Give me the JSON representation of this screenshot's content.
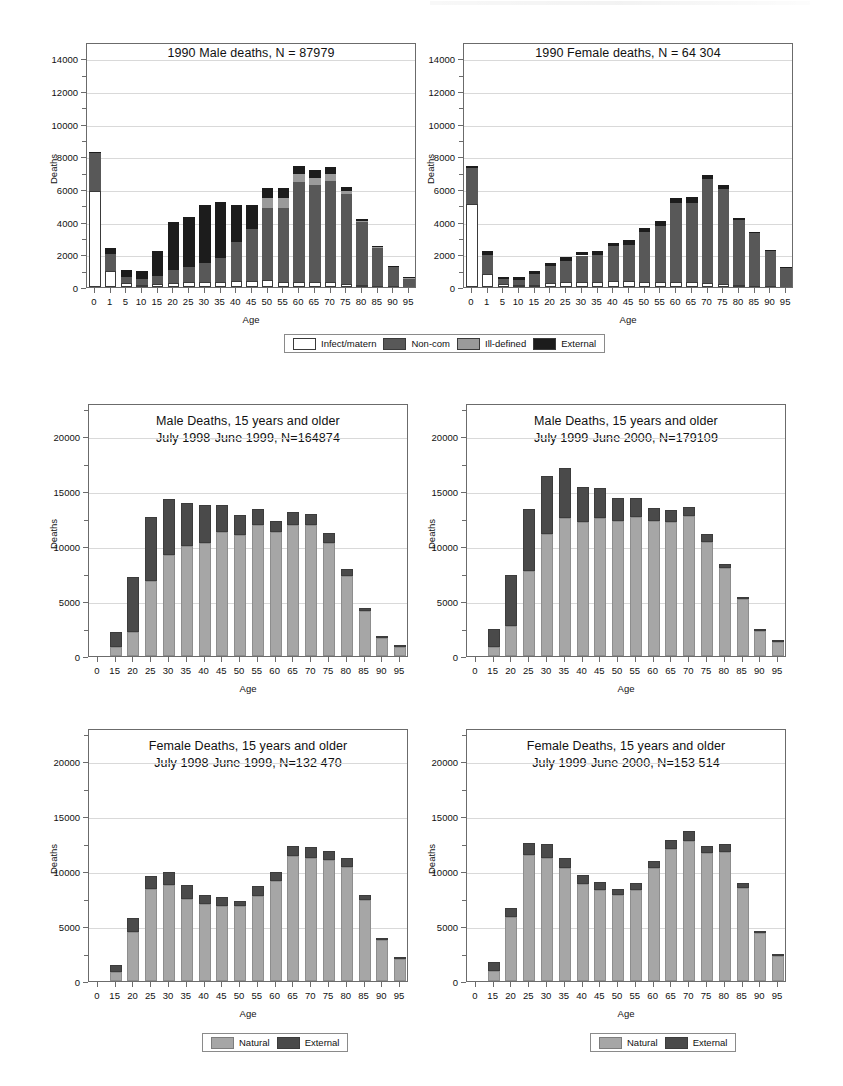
{
  "page": {
    "background": "#ffffff",
    "width": 843,
    "height": 1086
  },
  "colors": {
    "infect_matern": "#ffffff",
    "non_com": "#585858",
    "ill_defined": "#9a9a9a",
    "external_dark": "#1c1c1c",
    "natural": "#a6a6a6",
    "external": "#4a4a4a",
    "grid": "#d9d9d9",
    "axis": "#6b6b6b"
  },
  "legends": {
    "cause4": {
      "items": [
        {
          "label": "Infect/matern",
          "swatch": "infect"
        },
        {
          "label": "Non-com",
          "swatch": "noncom"
        },
        {
          "label": "Ill-defined",
          "swatch": "ill"
        },
        {
          "label": "External",
          "swatch": "external"
        }
      ]
    },
    "cause2_left": {
      "items": [
        {
          "label": "Natural",
          "swatch": "natural"
        },
        {
          "label": "External",
          "swatch": "extern2"
        }
      ]
    },
    "cause2_right": {
      "items": [
        {
          "label": "Natural",
          "swatch": "natural"
        },
        {
          "label": "External",
          "swatch": "extern2"
        }
      ]
    }
  },
  "chart_data": [
    {
      "id": "male-1990",
      "type": "bar",
      "stacked": true,
      "title": "1990 Male deaths, N = 87979",
      "title_lines": [
        "1990 Male deaths, N = 87979"
      ],
      "xlabel": "Age",
      "ylabel": "Deaths",
      "ylim": [
        0,
        15000
      ],
      "yticks": [
        0,
        2000,
        4000,
        6000,
        8000,
        10000,
        12000,
        14000
      ],
      "ytick_labels": [
        "0",
        "2000",
        "4000",
        "6000",
        "8000",
        "10000",
        "12000",
        "14000"
      ],
      "grid": true,
      "legend": "cause4",
      "legend_position": "below",
      "categories": [
        "0",
        "1",
        "5",
        "10",
        "15",
        "20",
        "25",
        "30",
        "35",
        "40",
        "45",
        "50",
        "55",
        "60",
        "65",
        "70",
        "75",
        "80",
        "85",
        "90",
        "95"
      ],
      "series": [
        {
          "name": "Infect/matern",
          "color": "#ffffff",
          "values": [
            5900,
            950,
            220,
            140,
            170,
            250,
            300,
            320,
            330,
            350,
            380,
            400,
            330,
            330,
            320,
            320,
            170,
            110,
            70,
            40,
            20
          ]
        },
        {
          "name": "Non-com",
          "color": "#585858",
          "values": [
            2300,
            1080,
            420,
            330,
            480,
            800,
            950,
            1150,
            1420,
            2400,
            3150,
            4450,
            4500,
            6100,
            5900,
            6200,
            5500,
            3850,
            2300,
            1190,
            540
          ]
        },
        {
          "name": "Ill-defined",
          "color": "#9a9a9a",
          "values": [
            0,
            0,
            0,
            0,
            0,
            0,
            0,
            0,
            0,
            0,
            0,
            620,
            620,
            480,
            480,
            420,
            230,
            100,
            80,
            40,
            20
          ]
        },
        {
          "name": "External",
          "color": "#1c1c1c",
          "values": [
            90,
            380,
            380,
            520,
            1570,
            2950,
            3050,
            3530,
            3450,
            2300,
            1490,
            620,
            600,
            480,
            440,
            420,
            230,
            120,
            70,
            40,
            20
          ]
        }
      ]
    },
    {
      "id": "female-1990",
      "type": "bar",
      "stacked": true,
      "title": "1990 Female deaths, N = 64 304",
      "title_lines": [
        "1990 Female deaths, N = 64 304"
      ],
      "xlabel": "Age",
      "ylabel": "Deaths",
      "ylim": [
        0,
        15000
      ],
      "yticks": [
        0,
        2000,
        4000,
        6000,
        8000,
        10000,
        12000,
        14000
      ],
      "ytick_labels": [
        "0",
        "2000",
        "4000",
        "6000",
        "8000",
        "10000",
        "12000",
        "14000"
      ],
      "grid": true,
      "legend": "cause4",
      "legend_position": "below",
      "categories": [
        "0",
        "1",
        "5",
        "10",
        "15",
        "20",
        "25",
        "30",
        "35",
        "40",
        "45",
        "50",
        "55",
        "60",
        "65",
        "70",
        "75",
        "80",
        "85",
        "90",
        "95"
      ],
      "series": [
        {
          "name": "Infect/matern",
          "color": "#ffffff",
          "values": [
            5100,
            800,
            180,
            120,
            150,
            230,
            280,
            300,
            320,
            340,
            340,
            330,
            330,
            320,
            320,
            250,
            200,
            130,
            80,
            50,
            20
          ]
        },
        {
          "name": "Non-com",
          "color": "#585858",
          "values": [
            2200,
            1150,
            320,
            330,
            640,
            1060,
            1310,
            1630,
            1670,
            2150,
            2250,
            3050,
            3400,
            4800,
            4850,
            6350,
            5800,
            4000,
            3200,
            2150,
            1200
          ]
        },
        {
          "name": "Ill-defined",
          "color": "#9a9a9a",
          "values": [
            0,
            0,
            0,
            0,
            0,
            0,
            0,
            0,
            0,
            0,
            0,
            0,
            0,
            0,
            0,
            0,
            0,
            0,
            0,
            0,
            0
          ]
        },
        {
          "name": "External",
          "color": "#1c1c1c",
          "values": [
            120,
            250,
            100,
            150,
            220,
            210,
            230,
            190,
            230,
            230,
            300,
            250,
            320,
            350,
            330,
            260,
            230,
            100,
            60,
            40,
            20
          ]
        }
      ]
    },
    {
      "id": "male-1998-1999",
      "type": "bar",
      "stacked": true,
      "title": "Male Deaths, 15 years and older",
      "title_lines": [
        "Male Deaths, 15 years and older",
        "July 1998-June 1999, N=164874"
      ],
      "xlabel": "Age",
      "ylabel": "Deaths",
      "ylim": [
        0,
        23000
      ],
      "yticks": [
        0,
        5000,
        10000,
        15000,
        20000
      ],
      "ytick_labels": [
        "0",
        "5000",
        "10000",
        "15000",
        "20000"
      ],
      "grid": true,
      "legend": null,
      "categories": [
        "0",
        "15",
        "20",
        "25",
        "30",
        "35",
        "40",
        "45",
        "50",
        "55",
        "60",
        "65",
        "70",
        "75",
        "80",
        "85",
        "90",
        "95"
      ],
      "series": [
        {
          "name": "Natural",
          "color": "#a6a6a6",
          "values": [
            0,
            800,
            2200,
            6800,
            9200,
            10000,
            10300,
            11300,
            11000,
            11900,
            11300,
            11950,
            11950,
            10300,
            7300,
            4100,
            1600,
            850
          ]
        },
        {
          "name": "External",
          "color": "#4a4a4a",
          "values": [
            0,
            1350,
            5000,
            5850,
            5100,
            3900,
            3400,
            2400,
            1800,
            1450,
            1000,
            1150,
            950,
            850,
            600,
            300,
            150,
            100
          ]
        }
      ]
    },
    {
      "id": "male-1999-2000",
      "type": "bar",
      "stacked": true,
      "title": "Male Deaths, 15 years and older",
      "title_lines": [
        "Male Deaths, 15 years and older",
        "July 1999-June 2000, N=179109"
      ],
      "xlabel": "Age",
      "ylabel": "Deaths",
      "ylim": [
        0,
        23000
      ],
      "yticks": [
        0,
        5000,
        10000,
        15000,
        20000
      ],
      "ytick_labels": [
        "0",
        "5000",
        "10000",
        "15000",
        "20000"
      ],
      "grid": true,
      "legend": null,
      "categories": [
        "0",
        "15",
        "20",
        "25",
        "30",
        "35",
        "40",
        "45",
        "50",
        "55",
        "60",
        "65",
        "70",
        "75",
        "80",
        "85",
        "90",
        "95"
      ],
      "series": [
        {
          "name": "Natural",
          "color": "#a6a6a6",
          "values": [
            0,
            800,
            2750,
            7700,
            11050,
            12550,
            12150,
            12550,
            12250,
            12600,
            12300,
            12150,
            12700,
            10350,
            8000,
            5200,
            2250,
            1250
          ]
        },
        {
          "name": "External",
          "color": "#4a4a4a",
          "values": [
            0,
            1700,
            4650,
            5700,
            5300,
            4500,
            3250,
            2700,
            2100,
            1750,
            1200,
            1150,
            850,
            700,
            400,
            150,
            100,
            80
          ]
        }
      ]
    },
    {
      "id": "female-1998-1999",
      "type": "bar",
      "stacked": true,
      "title": "Female Deaths, 15 years and older",
      "title_lines": [
        "Female Deaths, 15 years and older",
        "July 1998-June 1999, N=132 470"
      ],
      "xlabel": "Age",
      "ylabel": "Deaths",
      "ylim": [
        0,
        23000
      ],
      "yticks": [
        0,
        5000,
        10000,
        15000,
        20000
      ],
      "ytick_labels": [
        "0",
        "5000",
        "10000",
        "15000",
        "20000"
      ],
      "grid": true,
      "legend": "cause2_left",
      "legend_position": "below",
      "categories": [
        "0",
        "15",
        "20",
        "25",
        "30",
        "35",
        "40",
        "45",
        "50",
        "55",
        "60",
        "65",
        "70",
        "75",
        "80",
        "85",
        "90",
        "95"
      ],
      "series": [
        {
          "name": "Natural",
          "color": "#a6a6a6",
          "values": [
            0,
            800,
            4450,
            8400,
            8700,
            7450,
            7000,
            6800,
            6800,
            7700,
            9100,
            11400,
            11200,
            11000,
            10400,
            7350,
            3750,
            2000
          ]
        },
        {
          "name": "External",
          "color": "#4a4a4a",
          "values": [
            0,
            700,
            1250,
            1150,
            1250,
            1300,
            850,
            850,
            450,
            900,
            800,
            900,
            1000,
            800,
            800,
            450,
            150,
            100
          ]
        }
      ]
    },
    {
      "id": "female-1999-2000",
      "type": "bar",
      "stacked": true,
      "title": "Female Deaths, 15 years and older",
      "title_lines": [
        "Female Deaths, 15 years and older",
        "July 1999-June 2000, N=153 514"
      ],
      "xlabel": "Age",
      "ylabel": "Deaths",
      "ylim": [
        0,
        23000
      ],
      "yticks": [
        0,
        5000,
        10000,
        15000,
        20000
      ],
      "ytick_labels": [
        "0",
        "5000",
        "10000",
        "15000",
        "20000"
      ],
      "grid": true,
      "legend": "cause2_right",
      "legend_position": "below",
      "categories": [
        "0",
        "15",
        "20",
        "25",
        "30",
        "35",
        "40",
        "45",
        "50",
        "55",
        "60",
        "65",
        "70",
        "75",
        "80",
        "85",
        "90",
        "95"
      ],
      "series": [
        {
          "name": "Natural",
          "color": "#a6a6a6",
          "values": [
            0,
            900,
            5800,
            11500,
            11150,
            10250,
            8800,
            8300,
            7800,
            8300,
            10250,
            12000,
            12700,
            11600,
            11750,
            8500,
            4350,
            2250
          ]
        },
        {
          "name": "External",
          "color": "#4a4a4a",
          "values": [
            0,
            800,
            850,
            1050,
            1350,
            950,
            800,
            700,
            600,
            600,
            700,
            800,
            900,
            700,
            750,
            400,
            200,
            150
          ]
        }
      ]
    }
  ]
}
